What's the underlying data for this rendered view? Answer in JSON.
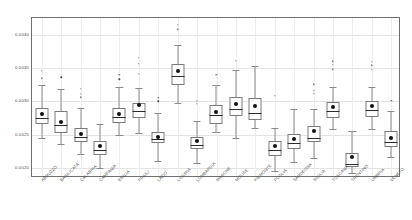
{
  "chart_data": {
    "type": "box",
    "title": "",
    "xlabel": "",
    "ylabel": "",
    "ylim": [
      0.00185,
      0.00425
    ],
    "grid": true,
    "legend": null,
    "yticks": [
      0.004,
      0.0035,
      0.003,
      0.0025,
      0.002
    ],
    "ytick_labels": [
      "0.0040",
      "0.0035",
      "0.0030",
      "0.0025",
      "0.0020"
    ],
    "categories": [
      "ABRUZZO",
      "BASILICATA",
      "CALABRIA",
      "CAMPANIA",
      "EMILIA",
      "FRIULI",
      "LAZIO",
      "LIGURIA",
      "LOMBARDIA",
      "MARCHE",
      "MOLISE",
      "PIEMONTE",
      "PUGLIA",
      "SARDEGNA",
      "SICILIA",
      "TOSCANA",
      "TRENTINO",
      "UMBRIA",
      "VENETO"
    ],
    "boxes": [
      {
        "label": "ABRUZZO",
        "whisker_low": 0.00245,
        "q1": 0.002665,
        "median": 0.002745,
        "q3": 0.002895,
        "whisker_high": 0.003245,
        "mean": 0.00281,
        "outliers": [
          0.003345,
          0.00346
        ]
      },
      {
        "label": "BASILICATA",
        "whisker_low": 0.002355,
        "q1": 0.00252,
        "median": 0.00264,
        "q3": 0.002855,
        "whisker_high": 0.003185,
        "mean": 0.00269,
        "outliers": [
          0.00336
        ]
      },
      {
        "label": "CALABRIA",
        "whisker_low": 0.002215,
        "q1": 0.00239,
        "median": 0.002465,
        "q3": 0.002595,
        "whisker_high": 0.002895,
        "mean": 0.002505,
        "outliers": [
          0.00306,
          0.00311,
          0.00319
        ]
      },
      {
        "label": "CAMPANIA",
        "whisker_low": 0.002,
        "q1": 0.002195,
        "median": 0.002265,
        "q3": 0.002405,
        "whisker_high": 0.00266,
        "mean": 0.002325,
        "outliers": []
      },
      {
        "label": "EMILIA",
        "whisker_low": 0.0025,
        "q1": 0.00268,
        "median": 0.00276,
        "q3": 0.002905,
        "whisker_high": 0.00322,
        "mean": 0.00281,
        "outliers": [
          0.00333,
          0.003395
        ]
      },
      {
        "label": "FRIULI",
        "whisker_low": 0.002525,
        "q1": 0.002755,
        "median": 0.002855,
        "q3": 0.00298,
        "whisker_high": 0.003195,
        "mean": 0.00294,
        "outliers": [
          0.003415,
          0.00356,
          0.00365
        ]
      },
      {
        "label": "LAZIO",
        "whisker_low": 0.002105,
        "q1": 0.002375,
        "median": 0.00244,
        "q3": 0.002545,
        "whisker_high": 0.00282,
        "mean": 0.00247,
        "outliers": [
          0.003,
          0.003055
        ]
      },
      {
        "label": "LIGURIA",
        "whisker_low": 0.002975,
        "q1": 0.00324,
        "median": 0.00338,
        "q3": 0.003555,
        "whisker_high": 0.00384,
        "mean": 0.003455,
        "outliers": [
          0.00408,
          0.004145
        ]
      },
      {
        "label": "LOMBARDIA",
        "whisker_low": 0.002075,
        "q1": 0.002285,
        "median": 0.00234,
        "q3": 0.00246,
        "whisker_high": 0.0027,
        "mean": 0.0024,
        "outliers": [
          0.00296,
          0.003005
        ]
      },
      {
        "label": "MARCHE",
        "whisker_low": 0.002545,
        "q1": 0.00266,
        "median": 0.00279,
        "q3": 0.00295,
        "whisker_high": 0.00325,
        "mean": 0.002845,
        "outliers": [
          0.003395
        ]
      },
      {
        "label": "MOLISE",
        "whisker_low": 0.002445,
        "q1": 0.002775,
        "median": 0.002885,
        "q3": 0.00306,
        "whisker_high": 0.00347,
        "mean": 0.00296,
        "outliers": [
          0.00361
        ]
      },
      {
        "label": "PIEMONTE",
        "whisker_low": 0.002595,
        "q1": 0.00272,
        "median": 0.002825,
        "q3": 0.003045,
        "whisker_high": 0.003525,
        "mean": 0.002935,
        "outliers": []
      },
      {
        "label": "PUGLIA",
        "whisker_low": 0.00196,
        "q1": 0.002175,
        "median": 0.002265,
        "q3": 0.00241,
        "whisker_high": 0.002605,
        "mean": 0.002335,
        "outliers": [
          0.00308
        ]
      },
      {
        "label": "SARDEGNA",
        "whisker_low": 0.002085,
        "q1": 0.00229,
        "median": 0.002375,
        "q3": 0.00251,
        "whisker_high": 0.002885,
        "mean": 0.00243,
        "outliers": []
      },
      {
        "label": "SICILIA",
        "whisker_low": 0.00215,
        "q1": 0.00239,
        "median": 0.002445,
        "q3": 0.00263,
        "whisker_high": 0.002885,
        "mean": 0.002555,
        "outliers": [
          0.00311,
          0.00316,
          0.003255
        ]
      },
      {
        "label": "TOSCANA",
        "whisker_low": 0.00258,
        "q1": 0.002755,
        "median": 0.00286,
        "q3": 0.00299,
        "whisker_high": 0.003215,
        "mean": 0.00292,
        "outliers": [
          0.00348,
          0.003545,
          0.0036
        ]
      },
      {
        "label": "TRENTINO",
        "whisker_low": 0.00193,
        "q1": 0.00202,
        "median": 0.002065,
        "q3": 0.00222,
        "whisker_high": 0.002555,
        "mean": 0.00217,
        "outliers": []
      },
      {
        "label": "UMBRIA",
        "whisker_low": 0.00259,
        "q1": 0.00276,
        "median": 0.002865,
        "q3": 0.003005,
        "whisker_high": 0.00322,
        "mean": 0.00293,
        "outliers": [
          0.00347,
          0.00354,
          0.00359
        ]
      },
      {
        "label": "VENETO",
        "whisker_low": 0.002165,
        "q1": 0.00231,
        "median": 0.00239,
        "q3": 0.00255,
        "whisker_high": 0.002855,
        "mean": 0.002455,
        "outliers": [
          0.003005
        ]
      }
    ]
  },
  "style": {
    "box_border_color": "#7a7a7a",
    "median_color": "#2b2b2b",
    "mean_marker_color": "#111111",
    "whisker_color": "#8a8a8a",
    "grid_color": "#e3e3e3",
    "frame_color": "#6f6f6f",
    "background": "#ffffff"
  }
}
